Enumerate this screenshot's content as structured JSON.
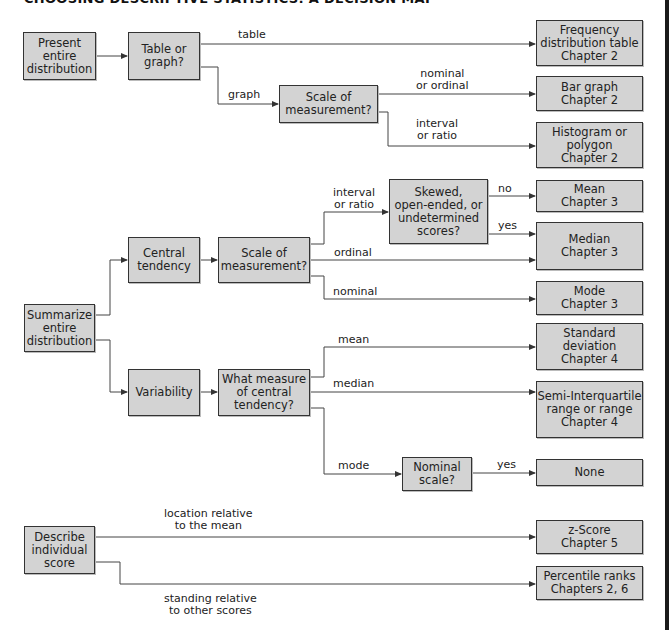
{
  "title": "CHOOSING DESCRIPTIVE STATISTICS: A DECISION MAP",
  "colors": {
    "box_fill": "#d3d3d3",
    "line": "#333333",
    "edge_bar": "#1a1a1a"
  },
  "section1": {
    "start": "Present\nentire\ndistribution",
    "decision": "Table or\ngraph?",
    "scale": "Scale of\nmeasurement?",
    "edges": {
      "table": "table",
      "graph": "graph",
      "nominal_ordinal": "nominal\nor ordinal",
      "interval_ratio": "interval\nor ratio"
    },
    "outcomes": {
      "frequency": "Frequency\ndistribution table\nChapter 2",
      "bar": "Bar graph\nChapter 2",
      "histogram": "Histogram or\npolygon\nChapter 2"
    }
  },
  "section2": {
    "start": "Summarize\nentire\ndistribution",
    "central": "Central\ntendency",
    "scale": "Scale of\nmeasurement?",
    "skewed": "Skewed,\nopen-ended, or\nundetermined\nscores?",
    "variability": "Variability",
    "which_measure": "What measure\nof central\ntendency?",
    "nominal_scale": "Nominal\nscale?",
    "edges": {
      "interval_ratio": "interval\nor ratio",
      "ordinal": "ordinal",
      "nominal": "nominal",
      "no": "no",
      "yes": "yes",
      "mean": "mean",
      "median": "median",
      "mode": "mode",
      "yes2": "yes"
    },
    "outcomes": {
      "mean": "Mean\nChapter 3",
      "median": "Median\nChapter 3",
      "mode": "Mode\nChapter 3",
      "sd": "Standard\ndeviation\nChapter 4",
      "siqr": "Semi-Interquartile\nrange or range\nChapter 4",
      "none": "None"
    }
  },
  "section3": {
    "start": "Describe\nindividual\nscore",
    "edges": {
      "location": "location relative\nto the mean",
      "standing": "standing relative\nto other scores"
    },
    "outcomes": {
      "zscore": "z-Score\nChapter 5",
      "percentile": "Percentile ranks\nChapters 2, 6"
    }
  }
}
